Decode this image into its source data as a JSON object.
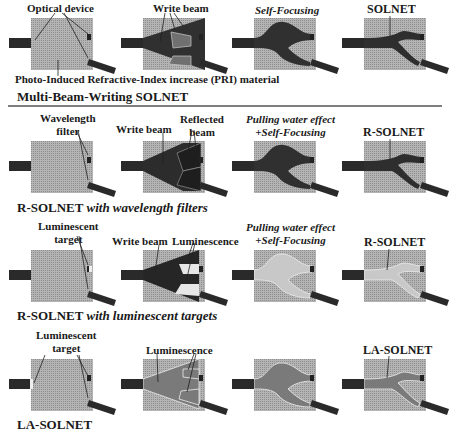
{
  "figure": {
    "rows": [
      {
        "title": "Multi-Beam-Writing SOLNET",
        "title_suffix": "",
        "labels": {
          "optical_device": "Optical device",
          "write_beam": "Write beam",
          "self_focusing": "Self-Focusing",
          "result": "SOLNET",
          "material": "Photo-Induced Refractive-Index increase (PRI) material"
        }
      },
      {
        "title": "R-SOLNET",
        "title_suffix": "with wavelength filters",
        "labels": {
          "filter_line1": "Wavelength",
          "filter_line2": "filter",
          "write_beam": "Write beam",
          "reflected_line1": "Reflected",
          "reflected_line2": "beam",
          "effect_line1": "Pulling water effect",
          "effect_line2": "+Self-Focusing",
          "result": "R-SOLNET"
        }
      },
      {
        "title": "R-SOLNET",
        "title_suffix": "with luminescent targets",
        "labels": {
          "target_line1": "Luminescent",
          "target_line2": "target",
          "write_beam": "Write beam",
          "luminescence": "Luminescence",
          "effect_line1": "Pulling water effect",
          "effect_line2": "+Self-Focusing",
          "result": "R-SOLNET"
        }
      },
      {
        "title": "LA-SOLNET",
        "title_suffix": "",
        "labels": {
          "target_line1": "Luminescent",
          "target_line2": "target",
          "luminescence": "Luminescence",
          "result": "LA-SOLNET"
        }
      }
    ],
    "colors": {
      "material": "#a8a8a8",
      "fiber": "#2a2a2a",
      "beam": "#333333",
      "luminescence": "#e6e6e6",
      "la_core": "#7a7a7a",
      "divider": "#555555"
    }
  }
}
